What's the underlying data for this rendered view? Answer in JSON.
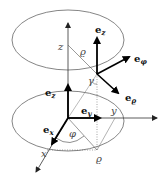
{
  "diagram": {
    "labels": {
      "z_axis": "z",
      "x_axis": "x",
      "y_axis": "y",
      "rho_upper": "ϱ",
      "rho_lower": "ϱ",
      "phi": "φ",
      "gamma": "γ"
    },
    "vectors": {
      "ez_point": {
        "base": "e",
        "sub": "z"
      },
      "ephi_point": {
        "base": "e",
        "sub": "φ"
      },
      "erho_point": {
        "base": "e",
        "sub": "ϱ"
      },
      "ez_origin": {
        "base": "e",
        "sub": "z"
      },
      "ey_origin": {
        "base": "e",
        "sub": "y"
      },
      "ex_origin": {
        "base": "e",
        "sub": "x"
      }
    },
    "colors": {
      "line": "#333333",
      "vector": "#000000",
      "ellipse": "#555555"
    }
  }
}
